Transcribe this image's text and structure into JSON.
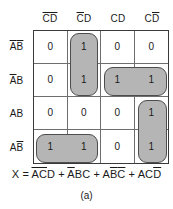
{
  "figure": {
    "type": "karnaugh-map",
    "caption": "(a)"
  },
  "kmap": {
    "column_headers": [
      {
        "plain": "CD",
        "display": "C̄D̄",
        "c": "complement",
        "d": "complement"
      },
      {
        "plain": "CD",
        "display": "C̄D",
        "c": "complement",
        "d": "true"
      },
      {
        "plain": "CD",
        "display": "CD",
        "c": "true",
        "d": "true"
      },
      {
        "plain": "CD",
        "display": "CD̄",
        "c": "true",
        "d": "complement"
      }
    ],
    "row_headers": [
      {
        "plain": "AB",
        "display": "ĀB̄",
        "a": "complement",
        "b": "complement"
      },
      {
        "plain": "AB",
        "display": "ĀB",
        "a": "complement",
        "b": "true"
      },
      {
        "plain": "AB",
        "display": "AB",
        "a": "true",
        "b": "true"
      },
      {
        "plain": "AB",
        "display": "AB̄",
        "a": "true",
        "b": "complement"
      }
    ],
    "cells": [
      [
        "0",
        "1",
        "0",
        "0"
      ],
      [
        "0",
        "1",
        "1",
        "1"
      ],
      [
        "0",
        "0",
        "0",
        "1"
      ],
      [
        "1",
        "1",
        "0",
        "1"
      ]
    ],
    "groups": [
      {
        "name": "group-col2-rows1-2",
        "row": 0,
        "col": 1,
        "rowspan": 2,
        "colspan": 1,
        "term": "ĀC̄D"
      },
      {
        "name": "group-row2-cols3-4",
        "row": 1,
        "col": 2,
        "rowspan": 1,
        "colspan": 2,
        "term": "ĀBC"
      },
      {
        "name": "group-col4-rows3-4",
        "row": 2,
        "col": 3,
        "rowspan": 2,
        "colspan": 1,
        "term": "ACD̄"
      },
      {
        "name": "group-row4-cols1-2",
        "row": 3,
        "col": 0,
        "rowspan": 1,
        "colspan": 2,
        "term": "AB̄C̄"
      }
    ],
    "group_fill_color": "#b5b5b5",
    "group_border_color": "#4d4d4d",
    "grid_line_color": "#6e6e6e"
  },
  "equation": {
    "output": "X",
    "equals": "=",
    "terms": [
      "ĀC̄D",
      "ĀBC",
      "AB̄C̄",
      "ACD̄"
    ],
    "operator": "+",
    "full_text": "X = ĀC̄D + ĀBC + AB̄C̄ + ACD̄"
  }
}
